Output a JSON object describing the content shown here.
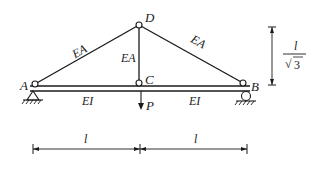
{
  "diagram": {
    "type": "truss-beam structure",
    "nodes": {
      "A": "A",
      "B": "B",
      "C": "C",
      "D": "D"
    },
    "members": {
      "AD": "EA",
      "DC": "EA",
      "DB": "EA",
      "AC": "EI",
      "CB": "EI"
    },
    "load": "P",
    "dimensions": {
      "left_span": "l",
      "right_span": "l",
      "height_num": "l",
      "height_den": "3"
    },
    "colors": {
      "line": "#1a1a1a",
      "background": "#ffffff"
    }
  }
}
